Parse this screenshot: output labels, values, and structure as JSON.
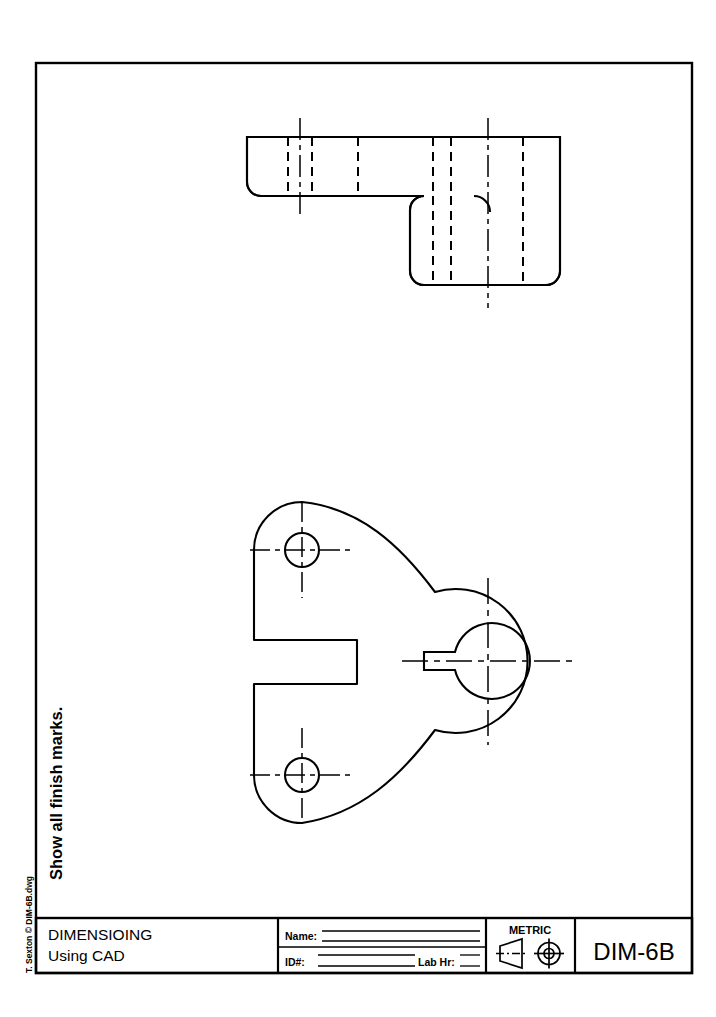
{
  "sheet": {
    "width": 716,
    "height": 1017,
    "background": "#ffffff",
    "ink": "#000000",
    "border": {
      "x": 36,
      "y": 63,
      "width": 656,
      "height": 910,
      "stroke_width": 2.2
    }
  },
  "margin_notes": {
    "instruction": "Show all finish marks.",
    "credit": "T. Sexton © DIM-6B.dwg"
  },
  "title_block": {
    "y": 918,
    "height": 55,
    "assignment_title": "DIMENSIOING",
    "assignment_subtitle": "Using CAD",
    "name_label": "Name:",
    "id_label": "ID#:",
    "lab_hr_label": "Lab Hr:",
    "units_label": "METRIC",
    "projection_symbol": "first-angle-projection",
    "drawing_number": "DIM-6B"
  },
  "views": {
    "top_view": {
      "name": "top-view",
      "description": "L-shaped stepped profile with rounded corners, hidden lines and centerlines",
      "outline": {
        "left": 247,
        "top": 137,
        "right": 560,
        "bottom": 285,
        "step_x": 410,
        "step_y": 196,
        "corner_radius": 14
      },
      "hidden_lines_upper": [
        288,
        312,
        358,
        433,
        451,
        523
      ],
      "hidden_lines_lower": [
        433,
        451,
        523
      ],
      "centerlines": [
        {
          "x": 300,
          "y1": 120,
          "y2": 213
        },
        {
          "x": 488,
          "y1": 120,
          "y2": 306
        }
      ],
      "fillet_arc": {
        "cx": 488,
        "cy": 196,
        "r": 14
      }
    },
    "front_view": {
      "name": "front-view",
      "description": "Triangular bracket plate with two bolt holes, central bored boss with keyway, and open rectangular slot",
      "holes": [
        {
          "name": "upper-bolt-hole",
          "cx": 302,
          "cy": 550,
          "r": 17
        },
        {
          "name": "lower-bolt-hole",
          "cx": 302,
          "cy": 775,
          "r": 17
        }
      ],
      "boss": {
        "name": "central-boss",
        "cx": 488,
        "cy": 661,
        "outer_r": 72,
        "bore_r": 38,
        "keyway": {
          "width": 26,
          "height": 17,
          "side": "left"
        }
      },
      "slot": {
        "name": "open-slot",
        "left": 254,
        "top": 640,
        "right": 357,
        "bottom": 684
      },
      "plate_edges": {
        "left_x": 254,
        "upper_lobe_cy": 550,
        "lower_lobe_cy": 775,
        "lobe_r": 48
      }
    }
  }
}
